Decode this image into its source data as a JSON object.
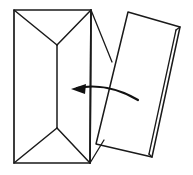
{
  "illustration": {
    "title": "Envelope and folded card insertion diagram",
    "style": "black-and-white line drawing",
    "background_color": "#ffffff",
    "stroke_color": "#1a1a1a",
    "arrow_color": "#111111",
    "canvas": {
      "width": 193,
      "height": 175
    },
    "objects": {
      "envelope": {
        "name": "envelope",
        "description": "Upright rectangular envelope, back side up, with triangular top and bottom flap seams meeting a vertical center seam",
        "outline_points": "14,10 91,10 90,163 14,163",
        "top_flap_left_seam": "14,10 57,45",
        "top_flap_right_seam": "91,10 57,45",
        "bottom_flap_left_seam": "14,163 57,128",
        "bottom_flap_right_seam": "90,163 57,128",
        "center_seam": "57,45 57,128",
        "right_edge": "91,10 90,163",
        "corner_spur_top": "91,10 112,62",
        "corner_spur_bottom": "90,163 104,140"
      },
      "card": {
        "name": "folded-card",
        "description": "Tilted folded card or letter shown to the right of the envelope, with a doubled edge indicating paper thickness",
        "outline_points": "128,12 180,27 152,157 96,144",
        "thickness_edge_outer": "180,27 152,157",
        "thickness_edge_inner": "176,30 149,154",
        "thickness_cap_top": "180,27 176,30",
        "thickness_cap_bottom": "152,157 149,154",
        "tilt_direction": "top tilted right, bottom tilted left"
      },
      "arrow": {
        "name": "insertion-arrow",
        "description": "Curved arrow sweeping from the card on the right toward the envelope on the left, indicating the card is inserted into the envelope",
        "direction": "right-to-left",
        "curve_path": "M 138,100 C 118,88 96,84 77,88",
        "head_tip": "71,89",
        "head_points": "71,89 86,84 85,94"
      }
    }
  }
}
